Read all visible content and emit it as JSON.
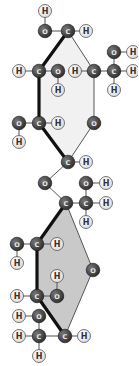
{
  "colors": {
    "background": "#ffffff",
    "heavy_atom": "#2e2e2e",
    "heavy_label": "#e8e8e8",
    "hydrogen": "#dcdcdc",
    "hydrogen_stroke": "#555555",
    "hydrogen_label": "#333333",
    "bond": "#555555",
    "bond_bold": "#111111",
    "ring_top_fill": "#f1f1f1",
    "ring_bottom_fill": "#c9c9c9"
  },
  "rings": [
    {
      "name": "top-ring",
      "fill": "#f1f1f1",
      "points": [
        [
          68,
          31
        ],
        [
          94,
          71
        ],
        [
          94,
          123
        ],
        [
          68,
          162
        ],
        [
          39,
          123
        ],
        [
          39,
          71
        ]
      ]
    },
    {
      "name": "bottom-ring",
      "fill": "#c9c9c9",
      "points": [
        [
          66,
          203
        ],
        [
          93,
          270
        ],
        [
          65,
          336
        ],
        [
          37,
          296
        ],
        [
          37,
          244
        ]
      ]
    }
  ],
  "atoms": [
    {
      "id": "h1",
      "el": "H",
      "x": 45,
      "y": 11
    },
    {
      "id": "o1",
      "el": "O",
      "x": 45,
      "y": 31
    },
    {
      "id": "c1",
      "el": "C",
      "x": 68,
      "y": 31
    },
    {
      "id": "h2",
      "el": "H",
      "x": 86,
      "y": 31
    },
    {
      "id": "h3",
      "el": "H",
      "x": 19,
      "y": 71
    },
    {
      "id": "c2",
      "el": "C",
      "x": 39,
      "y": 71
    },
    {
      "id": "o2",
      "el": "O",
      "x": 58,
      "y": 71
    },
    {
      "id": "h4",
      "el": "H",
      "x": 58,
      "y": 90
    },
    {
      "id": "h5",
      "el": "H",
      "x": 75,
      "y": 71
    },
    {
      "id": "c3",
      "el": "C",
      "x": 94,
      "y": 71
    },
    {
      "id": "c4",
      "el": "C",
      "x": 114,
      "y": 71
    },
    {
      "id": "h6",
      "el": "H",
      "x": 133,
      "y": 71
    },
    {
      "id": "o3",
      "el": "O",
      "x": 114,
      "y": 52
    },
    {
      "id": "h7",
      "el": "H",
      "x": 133,
      "y": 52
    },
    {
      "id": "h8",
      "el": "H",
      "x": 114,
      "y": 90
    },
    {
      "id": "o4",
      "el": "O",
      "x": 19,
      "y": 123
    },
    {
      "id": "c5",
      "el": "C",
      "x": 39,
      "y": 123
    },
    {
      "id": "h9",
      "el": "H",
      "x": 58,
      "y": 123
    },
    {
      "id": "h10",
      "el": "H",
      "x": 19,
      "y": 142
    },
    {
      "id": "o5",
      "el": "O",
      "x": 94,
      "y": 123
    },
    {
      "id": "c6",
      "el": "C",
      "x": 68,
      "y": 162
    },
    {
      "id": "h11",
      "el": "H",
      "x": 86,
      "y": 162
    },
    {
      "id": "o6",
      "el": "O",
      "x": 45,
      "y": 183
    },
    {
      "id": "o7",
      "el": "O",
      "x": 86,
      "y": 183
    },
    {
      "id": "h12",
      "el": "H",
      "x": 106,
      "y": 183
    },
    {
      "id": "c7",
      "el": "C",
      "x": 66,
      "y": 203
    },
    {
      "id": "c8",
      "el": "C",
      "x": 86,
      "y": 203
    },
    {
      "id": "h13",
      "el": "H",
      "x": 106,
      "y": 203
    },
    {
      "id": "h14",
      "el": "H",
      "x": 86,
      "y": 222
    },
    {
      "id": "o8",
      "el": "O",
      "x": 17,
      "y": 244
    },
    {
      "id": "c9",
      "el": "C",
      "x": 37,
      "y": 244
    },
    {
      "id": "h15",
      "el": "H",
      "x": 57,
      "y": 244
    },
    {
      "id": "h16",
      "el": "H",
      "x": 17,
      "y": 263
    },
    {
      "id": "o9",
      "el": "O",
      "x": 93,
      "y": 270
    },
    {
      "id": "h17",
      "el": "H",
      "x": 57,
      "y": 276
    },
    {
      "id": "h18",
      "el": "H",
      "x": 17,
      "y": 296
    },
    {
      "id": "c10",
      "el": "C",
      "x": 37,
      "y": 296
    },
    {
      "id": "o10",
      "el": "O",
      "x": 57,
      "y": 296
    },
    {
      "id": "h19",
      "el": "H",
      "x": 19,
      "y": 316
    },
    {
      "id": "o11",
      "el": "O",
      "x": 39,
      "y": 316
    },
    {
      "id": "h20",
      "el": "H",
      "x": 19,
      "y": 336
    },
    {
      "id": "c11",
      "el": "C",
      "x": 39,
      "y": 336
    },
    {
      "id": "c12",
      "el": "C",
      "x": 65,
      "y": 336
    },
    {
      "id": "h21",
      "el": "H",
      "x": 84,
      "y": 336
    },
    {
      "id": "h22",
      "el": "H",
      "x": 39,
      "y": 356
    }
  ],
  "bonds": [
    [
      "h1",
      "o1",
      0
    ],
    [
      "o1",
      "c1",
      0
    ],
    [
      "c1",
      "h2",
      0
    ],
    [
      "c1",
      "c2",
      1
    ],
    [
      "c1",
      "c3",
      0
    ],
    [
      "h3",
      "c2",
      0
    ],
    [
      "c2",
      "o2",
      0
    ],
    [
      "o2",
      "h4",
      0
    ],
    [
      "c2",
      "c5",
      1
    ],
    [
      "h5",
      "c3",
      0
    ],
    [
      "c3",
      "c4",
      0
    ],
    [
      "c4",
      "h6",
      0
    ],
    [
      "c4",
      "o3",
      0
    ],
    [
      "o3",
      "h7",
      0
    ],
    [
      "c4",
      "h8",
      0
    ],
    [
      "c3",
      "o5",
      0
    ],
    [
      "o4",
      "c5",
      0
    ],
    [
      "c5",
      "h9",
      0
    ],
    [
      "o4",
      "h10",
      0
    ],
    [
      "c5",
      "c6",
      1
    ],
    [
      "o5",
      "c6",
      0
    ],
    [
      "c6",
      "h11",
      0
    ],
    [
      "c6",
      "o6",
      0
    ],
    [
      "o6",
      "c7",
      0
    ],
    [
      "c7",
      "c8",
      0
    ],
    [
      "c8",
      "o7",
      0
    ],
    [
      "o7",
      "h12",
      0
    ],
    [
      "c8",
      "h13",
      0
    ],
    [
      "c8",
      "h14",
      0
    ],
    [
      "c7",
      "c9",
      1
    ],
    [
      "c7",
      "o9",
      0
    ],
    [
      "o8",
      "c9",
      0
    ],
    [
      "c9",
      "h15",
      0
    ],
    [
      "o8",
      "h16",
      0
    ],
    [
      "c9",
      "c10",
      1
    ],
    [
      "h18",
      "c10",
      0
    ],
    [
      "c10",
      "o10",
      0
    ],
    [
      "o10",
      "h17",
      0
    ],
    [
      "c10",
      "c12",
      1
    ],
    [
      "o9",
      "c12",
      0
    ],
    [
      "c12",
      "h21",
      0
    ],
    [
      "c12",
      "c11",
      0
    ],
    [
      "c11",
      "o11",
      0
    ],
    [
      "o11",
      "h19",
      0
    ],
    [
      "h20",
      "c11",
      0
    ],
    [
      "c11",
      "h22",
      0
    ]
  ]
}
